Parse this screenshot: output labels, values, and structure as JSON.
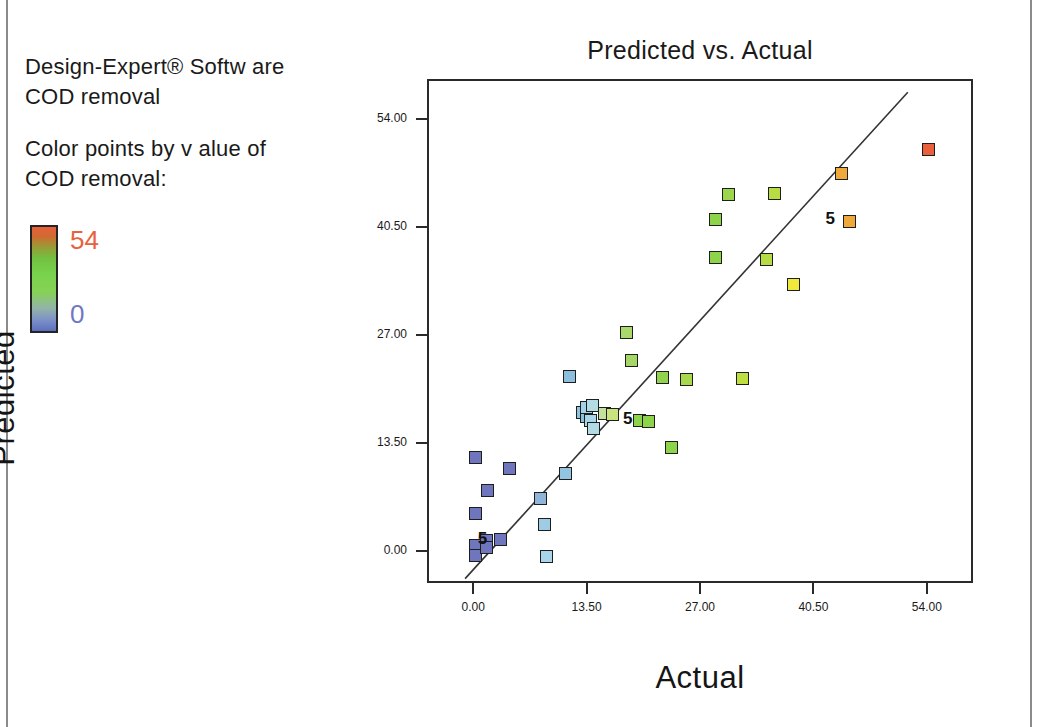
{
  "software": {
    "name": "Design-Expert® Softw are",
    "response": "COD removal"
  },
  "legend": {
    "caption_line1": "Color points by v alue of",
    "caption_line2": "COD removal:",
    "high_value": "54",
    "low_value": "0",
    "high_color": "#e8603c",
    "low_color": "#6f78c4",
    "bar_top_color": "#e8603c",
    "bar_mid_color": "#7ed24d",
    "bar_bottom_color": "#5c6fbe"
  },
  "chart_data": {
    "type": "scatter",
    "title": "Predicted vs. Actual",
    "xlabel": "Actual",
    "ylabel": "Predicted",
    "xlim": [
      -5.5,
      59.5
    ],
    "ylim": [
      -4.0,
      59.0
    ],
    "xticks": [
      "0.00",
      "13.50",
      "27.00",
      "40.50",
      "54.00"
    ],
    "yticks": [
      "0.00",
      "13.50",
      "27.00",
      "40.50",
      "54.00"
    ],
    "xtick_values": [
      0,
      13.5,
      27,
      40.5,
      54
    ],
    "ytick_values": [
      0,
      13.5,
      27,
      40.5,
      54
    ],
    "grid": false,
    "legend_position": "outside-left",
    "reference_line": {
      "label": "45-degree line",
      "x_start": -1.2,
      "y_start": -3.2,
      "x_end": 51.5,
      "y_end": 57.6,
      "color": "#333333"
    },
    "color_scale": {
      "variable": "COD removal",
      "min": 0,
      "max": 54,
      "colors": [
        "#5c6fbe",
        "#7b8fc8",
        "#93c8e0",
        "#7ed24d",
        "#b7dd3c",
        "#f1e83c",
        "#efa93a",
        "#e8603c"
      ]
    },
    "points": [
      {
        "x": 0.0,
        "y": 11.9,
        "color": "#6f76bd"
      },
      {
        "x": 0.0,
        "y": 5.0,
        "color": "#6f76bd"
      },
      {
        "x": 0.0,
        "y": 0.9,
        "color": "#6f76bd"
      },
      {
        "x": 0.0,
        "y": -0.3,
        "color": "#6f76bd"
      },
      {
        "x": 1.4,
        "y": 1.6,
        "color": "#6f76bd"
      },
      {
        "x": 1.4,
        "y": 0.7,
        "color": "#6f76bd"
      },
      {
        "x": 1.5,
        "y": 7.8,
        "color": "#6f76bd"
      },
      {
        "x": 3.0,
        "y": 1.7,
        "color": "#6f76bd"
      },
      {
        "x": 4.1,
        "y": 10.6,
        "color": "#6f76bd"
      },
      {
        "x": 7.8,
        "y": 6.8,
        "color": "#8fb6da"
      },
      {
        "x": 8.3,
        "y": 3.6,
        "color": "#9ecce5"
      },
      {
        "x": 8.5,
        "y": -0.4,
        "color": "#a8d6ea"
      },
      {
        "x": 10.8,
        "y": 9.9,
        "color": "#93c4e0"
      },
      {
        "x": 11.2,
        "y": 22.1,
        "color": "#8cbfdd"
      },
      {
        "x": 12.8,
        "y": 17.6,
        "color": "#8fc4e0"
      },
      {
        "x": 13.2,
        "y": 17.1,
        "color": "#8cc1de"
      },
      {
        "x": 13.3,
        "y": 18.2,
        "color": "#a4d3e8"
      },
      {
        "x": 13.7,
        "y": 16.6,
        "color": "#a9d7ea"
      },
      {
        "x": 14.0,
        "y": 18.4,
        "color": "#b4dce5"
      },
      {
        "x": 14.1,
        "y": 15.6,
        "color": "#b2dbe6"
      },
      {
        "x": 15.4,
        "y": 17.5,
        "color": "#c3e19d"
      },
      {
        "x": 16.4,
        "y": 17.3,
        "color": "#c9e47f"
      },
      {
        "x": 18.0,
        "y": 27.6,
        "color": "#aad96b"
      },
      {
        "x": 18.6,
        "y": 24.1,
        "color": "#a4d765"
      },
      {
        "x": 19.6,
        "y": 16.6,
        "color": "#8ed44a"
      },
      {
        "x": 20.6,
        "y": 16.5,
        "color": "#8ed44a"
      },
      {
        "x": 22.3,
        "y": 21.9,
        "color": "#93d24e"
      },
      {
        "x": 23.4,
        "y": 13.2,
        "color": "#8ed44a"
      },
      {
        "x": 25.2,
        "y": 21.7,
        "color": "#a7d84e"
      },
      {
        "x": 28.6,
        "y": 36.9,
        "color": "#8ed44a"
      },
      {
        "x": 28.6,
        "y": 41.7,
        "color": "#8ed44a"
      },
      {
        "x": 30.1,
        "y": 44.8,
        "color": "#9bd64c"
      },
      {
        "x": 31.8,
        "y": 21.8,
        "color": "#bede42"
      },
      {
        "x": 34.7,
        "y": 36.7,
        "color": "#b5dc45"
      },
      {
        "x": 35.6,
        "y": 45.0,
        "color": "#b8dd44"
      },
      {
        "x": 37.9,
        "y": 33.6,
        "color": "#f1e83c"
      },
      {
        "x": 43.6,
        "y": 47.4,
        "color": "#efa93a"
      },
      {
        "x": 44.5,
        "y": 41.5,
        "color": "#efa93a"
      },
      {
        "x": 54.0,
        "y": 50.5,
        "color": "#e8603c"
      }
    ],
    "annotations": [
      {
        "label": "5",
        "x": 0.9,
        "y": 1.8
      },
      {
        "label": "5",
        "x": 18.2,
        "y": 16.8
      },
      {
        "label": "5",
        "x": 42.3,
        "y": 41.7
      }
    ]
  }
}
